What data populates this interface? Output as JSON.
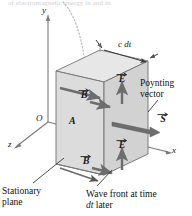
{
  "figure": {
    "clipped_header_text": "of electromagnetic energy in     and in",
    "type": "physics-diagram"
  },
  "axes": {
    "y_label": "y",
    "x_label": "x",
    "z_label": "z",
    "origin_label": "O"
  },
  "slab": {
    "area_label": "A",
    "thickness_label": "c dt",
    "front_face_color": "#d8d8d8",
    "back_face_color": "#cfcfcf",
    "top_face_color": "#e4e4e4",
    "edge_color": "#6b6b6b"
  },
  "vectors": {
    "e_upper": "E",
    "b_upper": "B",
    "e_lower": "E",
    "b_lower": "B",
    "s": "S",
    "arrow_color": "#6d6d6d"
  },
  "callouts": {
    "poynting_line1": "Poynting",
    "poynting_line2": "vector",
    "stationary_line1": "Stationary",
    "stationary_line2": "plane",
    "wavefront_line1": "Wave front at time",
    "wavefront_line2_italic": "dt",
    "wavefront_line2_rest": " later"
  }
}
